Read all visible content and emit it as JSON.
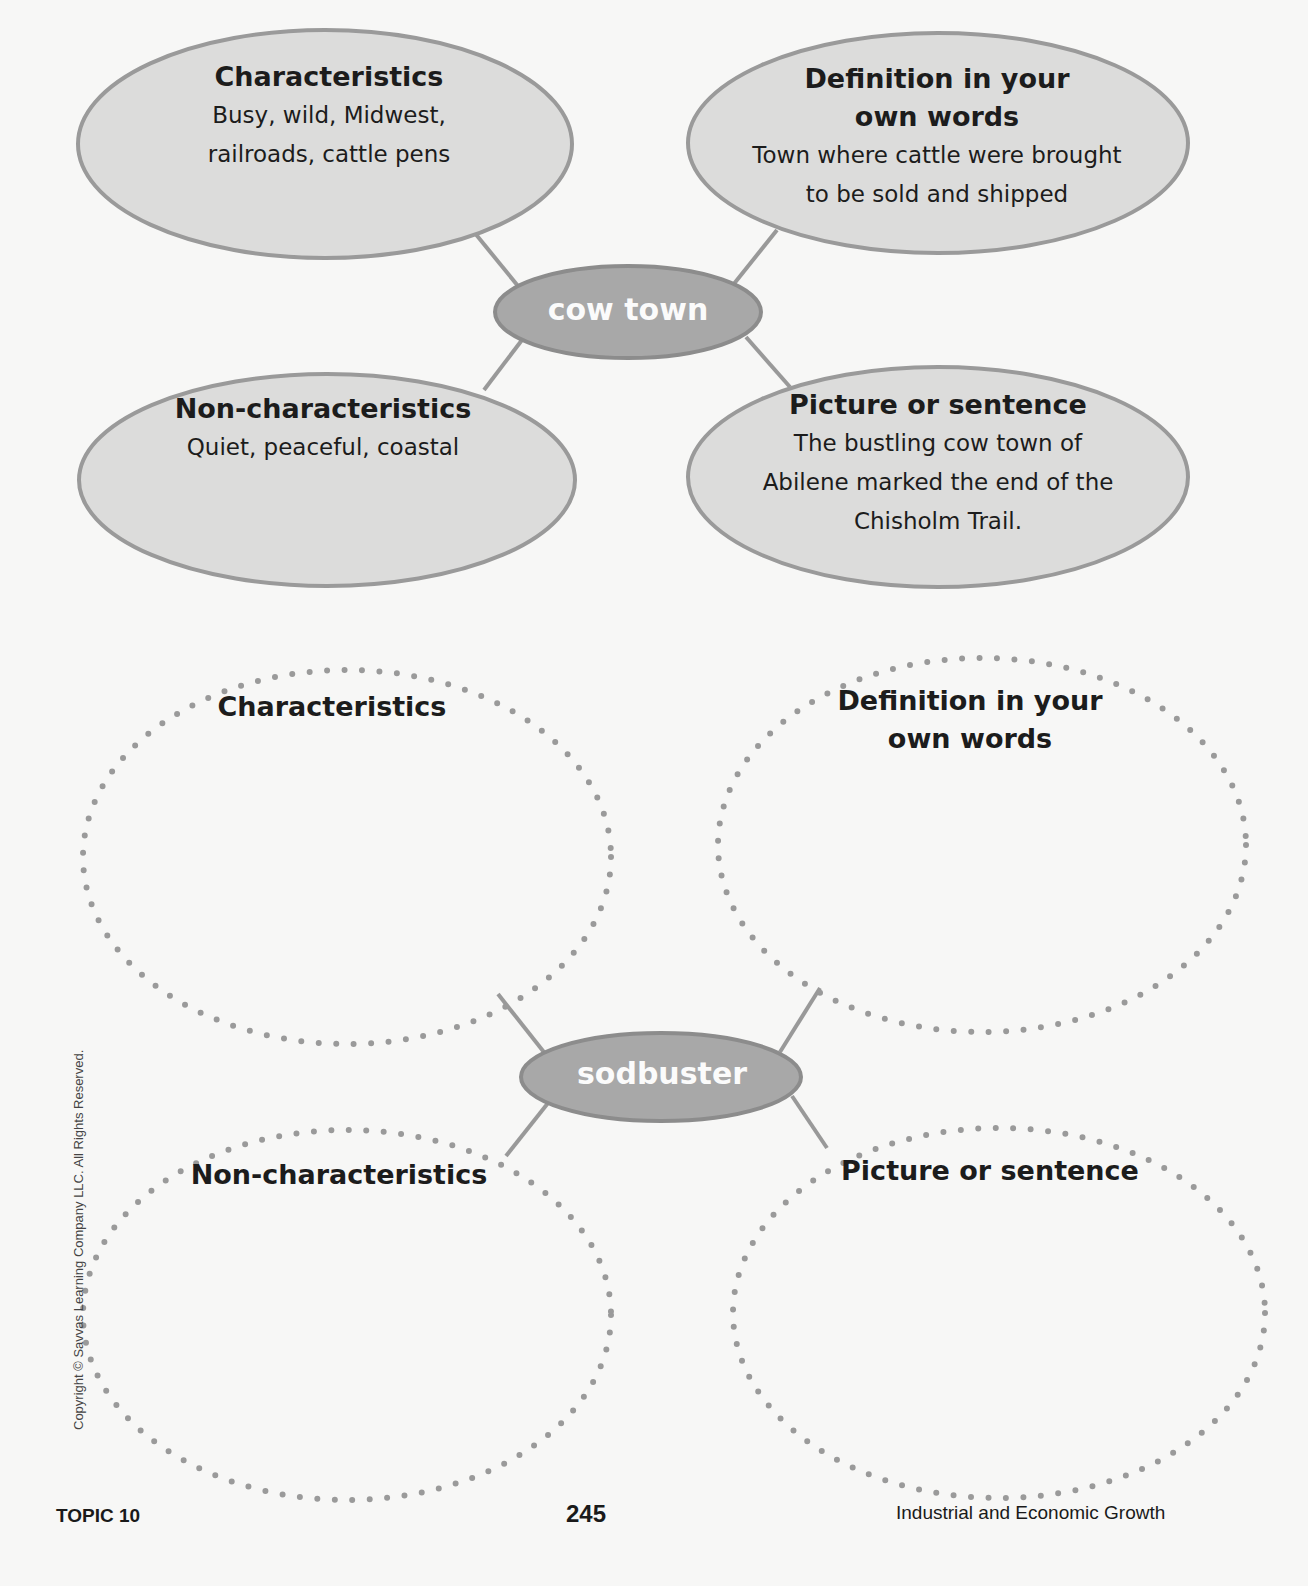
{
  "diagram_1": {
    "center_term": "cow town",
    "characteristics": {
      "heading": "Characteristics",
      "lines": [
        "Busy, wild, Midwest,",
        "railroads, cattle pens"
      ]
    },
    "definition": {
      "heading_lines": [
        "Definition in your",
        "own words"
      ],
      "lines": [
        "Town where cattle were brought",
        "to be sold and shipped"
      ]
    },
    "non_characteristics": {
      "heading": "Non-characteristics",
      "lines": [
        "Quiet, peaceful, coastal"
      ]
    },
    "picture_or_sentence": {
      "heading": "Picture or sentence",
      "lines": [
        "The bustling cow town of",
        "Abilene marked the end of the",
        "Chisholm Trail."
      ]
    }
  },
  "diagram_2": {
    "center_term": "sodbuster",
    "characteristics": {
      "heading": "Characteristics",
      "answer": ""
    },
    "definition": {
      "heading_lines": [
        "Definition in your",
        "own words"
      ],
      "answer": ""
    },
    "non_characteristics": {
      "heading": "Non-characteristics",
      "answer": ""
    },
    "picture_or_sentence": {
      "heading": "Picture or sentence",
      "answer": ""
    }
  },
  "footer": {
    "topic": "TOPIC 10",
    "page_number": "245",
    "chapter_title": "Industrial and Economic Growth",
    "copyright": "Copyright © Savvas Learning Company LLC. All Rights Reserved."
  },
  "colors": {
    "bubble_fill": "#dcdcdb",
    "bubble_border": "#999999",
    "center_fill": "#a8a8a8",
    "center_border": "#8c8c8c",
    "connector": "#999999",
    "dotted_outline": "#9a9a9a"
  }
}
